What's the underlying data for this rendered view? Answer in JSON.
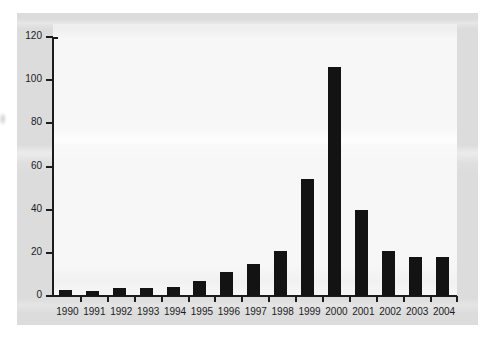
{
  "chart_data": {
    "type": "bar",
    "title": "",
    "subtitle": "",
    "xlabel": "",
    "ylabel": "",
    "categories": [
      "1990",
      "1991",
      "1992",
      "1993",
      "1994",
      "1995",
      "1996",
      "1997",
      "1998",
      "1999",
      "2000",
      "2001",
      "2002",
      "2003",
      "2004"
    ],
    "values": [
      3,
      2.5,
      3.5,
      3.5,
      4,
      7,
      11,
      15,
      21,
      54,
      106,
      40,
      21,
      18,
      18
    ],
    "series": [
      {
        "name": "",
        "values": [
          3,
          2.5,
          3.5,
          3.5,
          4,
          7,
          11,
          15,
          21,
          54,
          106,
          40,
          21,
          18,
          18
        ]
      }
    ],
    "ylim": [
      0,
      120
    ],
    "y_ticks": [
      0,
      20,
      40,
      60,
      80,
      100,
      120
    ],
    "y_tick_labels": [
      "0",
      "20",
      "40",
      "60",
      "80",
      "100",
      "120"
    ],
    "x_tick_labels": [
      "1990",
      "1991",
      "1992",
      "1993",
      "1994",
      "1995",
      "1996",
      "1997",
      "1998",
      "1999",
      "2000",
      "2001",
      "2002",
      "2003",
      "2004"
    ],
    "grid": false,
    "legend": null,
    "legend_position": "none",
    "annotations": [],
    "colors": {
      "bar": "#131313",
      "axis": "#1c1c1c",
      "panel_background": "#dcdcdc",
      "plot_background": "#f7f7f7",
      "text": "#1b1b1b",
      "page_background": "#ffffff"
    }
  }
}
